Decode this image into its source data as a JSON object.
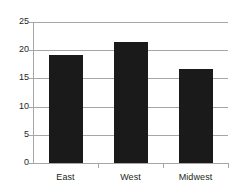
{
  "chart_data": {
    "type": "bar",
    "title": "",
    "subtitle": "",
    "xlabel": "",
    "ylabel": "",
    "categories": [
      "East",
      "West",
      "Midwest"
    ],
    "values": [
      19.2,
      21.4,
      16.7
    ],
    "series": [
      {
        "name": "Series 1",
        "values": [
          19.2,
          21.4,
          16.7
        ]
      }
    ],
    "ylim": [
      0,
      25
    ],
    "yticks": [
      0,
      5,
      10,
      15,
      20,
      25
    ],
    "ytick_labels": [
      "0",
      "5",
      "10",
      "15",
      "20",
      "25"
    ],
    "grid": "horizontal",
    "legend": "none",
    "bar_color": "#1a1a1a",
    "grid_color": "#a6a6a6",
    "axis_color": "#a6a6a6",
    "background_color": "#ffffff",
    "text_color": "#231f20",
    "annotations": []
  }
}
